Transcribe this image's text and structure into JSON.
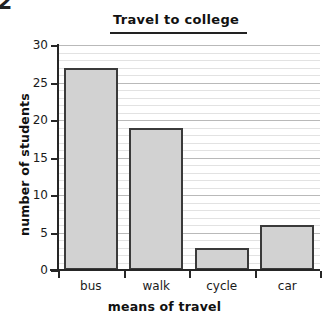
{
  "artifact": {
    "corner_text": "2"
  },
  "chart_data": {
    "type": "bar",
    "title": "Travel to college",
    "xlabel": "means of travel",
    "ylabel": "number of students",
    "categories": [
      "bus",
      "walk",
      "cycle",
      "car"
    ],
    "values": [
      27,
      19,
      3,
      6
    ],
    "ylim": [
      0,
      30
    ],
    "y_major_ticks": [
      0,
      5,
      10,
      15,
      20,
      25,
      30
    ],
    "y_tick_labels": [
      "0",
      "5",
      "10",
      "15",
      "20",
      "25",
      "30"
    ],
    "y_minor_step": 1,
    "grid": true,
    "legend": null,
    "colors": {
      "bar_fill": "#d2d2d2",
      "bar_stroke": "#3a3a3a",
      "axis": "#262626",
      "grid_minor": "#e2e2e2",
      "grid_major": "#b9b9b9",
      "background": "#ffffff",
      "text": "#1a1a1a"
    }
  }
}
